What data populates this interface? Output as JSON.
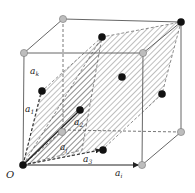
{
  "diagram": {
    "labels": {
      "origin": "O",
      "a_k": "a",
      "a_k_sub": "k",
      "a_1": "a",
      "a_1_sub": "1",
      "a_2": "a",
      "a_2_sub": "2",
      "a_j": "a",
      "a_j_sub": "j",
      "a_3": "a",
      "a_3_sub": "3",
      "a_i": "a",
      "a_i_sub": "i"
    },
    "colors": {
      "edge": "#555555",
      "black_atom": "#111111",
      "gray_atom": "#bdbdbd",
      "hatch": "#444444"
    }
  }
}
